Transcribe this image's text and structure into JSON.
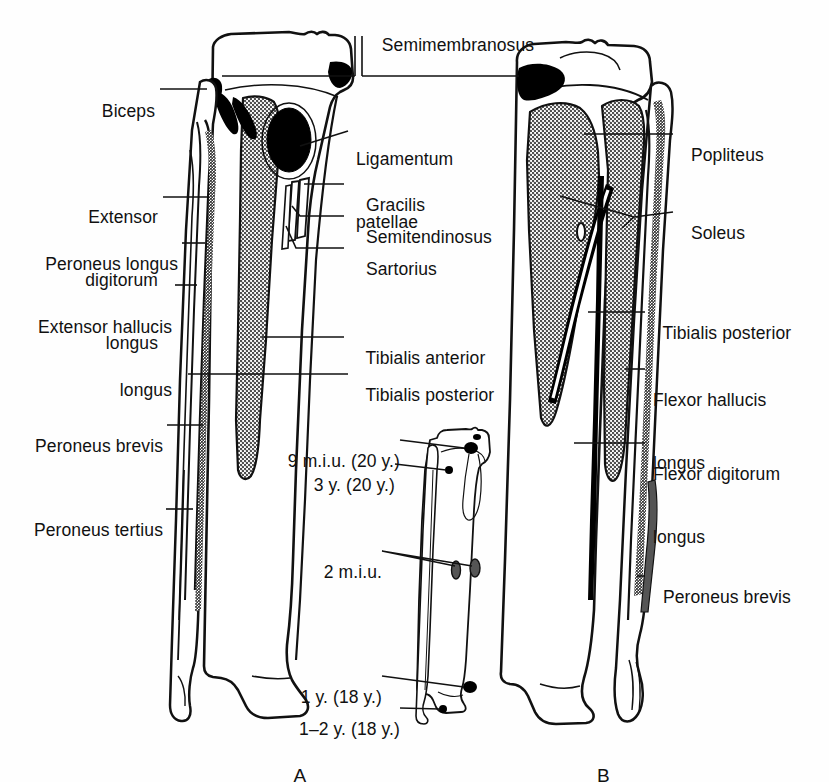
{
  "figure": {
    "type": "anatomical-diagram",
    "panels": [
      {
        "id": "A",
        "label": "A",
        "view": "anterior"
      },
      {
        "id": "B",
        "label": "B",
        "view": "posterior"
      },
      {
        "id": "C",
        "label": "",
        "view": "ossification-centres"
      }
    ],
    "colors": {
      "ink": "#111111",
      "background": "#fefefe",
      "shaded_attachment": "#9a9a9a",
      "solid_black_attachment": "#000000"
    }
  },
  "labels_top": [
    {
      "name": "semimembranosus",
      "text": "Semimembranosus"
    }
  ],
  "labels_left": [
    {
      "name": "biceps",
      "text": "Biceps"
    },
    {
      "name": "extensor-digitorum-longus",
      "line1": "Extensor",
      "line2": "digitorum",
      "line3": "longus"
    },
    {
      "name": "peroneus-longus",
      "text": "Peroneus longus"
    },
    {
      "name": "extensor-hallucis-longus",
      "line1": "Extensor hallucis",
      "line2": "longus"
    },
    {
      "name": "peroneus-brevis-a",
      "text": "Peroneus brevis"
    },
    {
      "name": "peroneus-tertius",
      "text": "Peroneus tertius"
    }
  ],
  "labels_center": [
    {
      "name": "ligamentum-patellae",
      "line1": "Ligamentum",
      "line2": "patellae"
    },
    {
      "name": "gracilis",
      "text": "Gracilis"
    },
    {
      "name": "semitendinosus",
      "text": "Semitendinosus"
    },
    {
      "name": "sartorius",
      "text": "Sartorius"
    },
    {
      "name": "tibialis-anterior",
      "text": "Tibialis anterior"
    },
    {
      "name": "tibialis-posterior-a",
      "text": "Tibialis posterior"
    }
  ],
  "labels_right": [
    {
      "name": "popliteus",
      "text": "Popliteus"
    },
    {
      "name": "soleus",
      "text": "Soleus"
    },
    {
      "name": "tibialis-posterior-b",
      "text": "Tibialis posterior"
    },
    {
      "name": "flexor-hallucis-longus",
      "line1": "Flexor hallucis",
      "line2": "longus"
    },
    {
      "name": "flexor-digitorum-longus",
      "line1": "Flexor digitorum",
      "line2": "longus"
    },
    {
      "name": "peroneus-brevis-b",
      "text": "Peroneus brevis"
    }
  ],
  "ossification_labels": [
    {
      "name": "ossif-9miu-20y",
      "text": "9 m.i.u. (20 y.)"
    },
    {
      "name": "ossif-3y-20y",
      "text": "3 y. (20 y.)"
    },
    {
      "name": "ossif-2miu",
      "text": "2 m.i.u."
    },
    {
      "name": "ossif-1y-18y",
      "text": "1 y. (18 y.)"
    },
    {
      "name": "ossif-1-2y-18y",
      "text": "1–2 y. (18 y.)"
    }
  ],
  "panel_captions": {
    "a": "A",
    "b": "B"
  }
}
